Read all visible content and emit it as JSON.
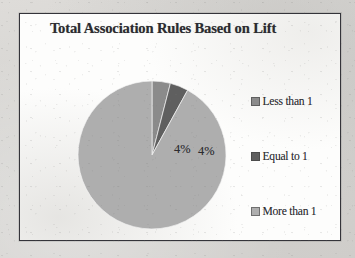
{
  "figure": {
    "title": "Total Association Rules Based on Lift",
    "frame_border_color": "#34343a",
    "plot_background": "#fdfdfc",
    "page_background": "#d8d7d4"
  },
  "legend": {
    "position": "right",
    "entries": [
      {
        "label": "Less than 1",
        "swatch_name": "legend-swatch-less-than-1",
        "color": "#8b8b8b"
      },
      {
        "label": "Equal to 1",
        "swatch_name": "legend-swatch-equal-to-1",
        "color": "#5f5f5f"
      },
      {
        "label": "More than 1",
        "swatch_name": "legend-swatch-more-than-1",
        "color": "#aeaeae"
      }
    ]
  },
  "chart_data": {
    "type": "pie",
    "title": "Total Association Rules Based on Lift",
    "xlabel": "",
    "ylabel": "",
    "grid": false,
    "legend_position": "right",
    "start_angle_deg": 90,
    "direction": "clockwise",
    "categories": [
      "Less than 1",
      "Equal to 1",
      "More than 1"
    ],
    "values": [
      4,
      92,
      4
    ],
    "value_unit": "percent",
    "slices": [
      {
        "label": "Less than 1",
        "value": 4,
        "data_label": "4%",
        "color": "#8b8b8b"
      },
      {
        "label": "Equal to 1",
        "value": 4,
        "data_label": "4%",
        "color": "#5f5f5f"
      },
      {
        "label": "More than 1",
        "value": 92,
        "data_label": "92%",
        "color": "#aeaeae"
      }
    ],
    "data_labels": [
      "4%",
      "4%",
      "92%"
    ],
    "annotations": []
  }
}
